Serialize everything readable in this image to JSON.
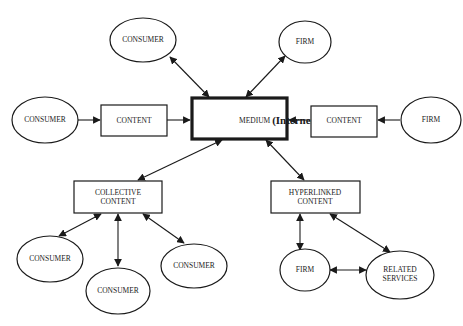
{
  "diagram": {
    "nodes": {
      "medium": {
        "label_prefix": "MEDIUM ",
        "label_emphasis": "(Internet)",
        "shape": "rectangle-thick"
      },
      "consumer_top": {
        "label": "CONSUMER",
        "shape": "ellipse"
      },
      "firm_top": {
        "label": "FIRM",
        "shape": "ellipse"
      },
      "consumer_left": {
        "label": "CONSUMER",
        "shape": "ellipse"
      },
      "content_left": {
        "label": "CONTENT",
        "shape": "rectangle"
      },
      "content_right": {
        "label": "CONTENT",
        "shape": "rectangle"
      },
      "firm_right": {
        "label": "FIRM",
        "shape": "ellipse"
      },
      "collective_content": {
        "label_line1": "COLLECTIVE",
        "label_line2": "CONTENT",
        "shape": "rectangle"
      },
      "hyperlinked_content": {
        "label_line1": "HYPERLINKED",
        "label_line2": "CONTENT",
        "shape": "rectangle"
      },
      "consumer_bottom_left": {
        "label": "CONSUMER",
        "shape": "ellipse"
      },
      "consumer_bottom_middle": {
        "label": "CONSUMER",
        "shape": "ellipse"
      },
      "consumer_bottom_right": {
        "label": "CONSUMER",
        "shape": "ellipse"
      },
      "firm_bottom": {
        "label": "FIRM",
        "shape": "ellipse"
      },
      "related_services": {
        "label_line1": "RELATED",
        "label_line2": "SERVICES",
        "shape": "ellipse"
      }
    },
    "edges": [
      {
        "from": "consumer_top",
        "to": "medium",
        "direction": "both"
      },
      {
        "from": "firm_top",
        "to": "medium",
        "direction": "both"
      },
      {
        "from": "consumer_left",
        "to": "content_left",
        "direction": "forward"
      },
      {
        "from": "content_left",
        "to": "medium",
        "direction": "forward"
      },
      {
        "from": "firm_right",
        "to": "content_right",
        "direction": "forward"
      },
      {
        "from": "content_right",
        "to": "medium",
        "direction": "forward"
      },
      {
        "from": "medium",
        "to": "collective_content",
        "direction": "both"
      },
      {
        "from": "medium",
        "to": "hyperlinked_content",
        "direction": "both"
      },
      {
        "from": "collective_content",
        "to": "consumer_bottom_left",
        "direction": "both"
      },
      {
        "from": "collective_content",
        "to": "consumer_bottom_middle",
        "direction": "both"
      },
      {
        "from": "collective_content",
        "to": "consumer_bottom_right",
        "direction": "both"
      },
      {
        "from": "hyperlinked_content",
        "to": "firm_bottom",
        "direction": "both"
      },
      {
        "from": "hyperlinked_content",
        "to": "related_services",
        "direction": "both"
      },
      {
        "from": "firm_bottom",
        "to": "related_services",
        "direction": "both"
      }
    ]
  }
}
